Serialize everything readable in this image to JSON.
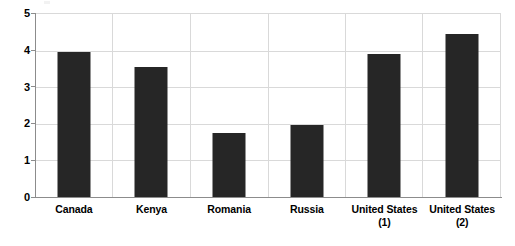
{
  "chart_data": {
    "type": "bar",
    "title": "",
    "subtitle": "",
    "xlabel": "",
    "ylabel": "",
    "categories": [
      "Canada",
      "Kenya",
      "Romania",
      "Russia",
      "United States (1)",
      "United States (2)"
    ],
    "category_lines": [
      [
        "Canada"
      ],
      [
        "Kenya"
      ],
      [
        "Romania"
      ],
      [
        "Russia"
      ],
      [
        "United States",
        "(1)"
      ],
      [
        "United States",
        "(2)"
      ]
    ],
    "values": [
      3.93,
      3.53,
      1.75,
      1.97,
      3.89,
      4.43
    ],
    "series": [
      {
        "name": "",
        "values": [
          3.93,
          3.53,
          1.75,
          1.97,
          3.89,
          4.43
        ]
      }
    ],
    "ylim": [
      0,
      5
    ],
    "ytick_labels": [
      "5",
      "4",
      "3",
      "2",
      "1",
      "0"
    ],
    "ytick_values": [
      5,
      4,
      3,
      2,
      1,
      0
    ],
    "grid": {
      "horizontal": true,
      "vertical": true
    },
    "legend": {
      "visible": false,
      "position": "none",
      "entries": []
    },
    "colors": {
      "bar": "#262626",
      "gridline": "#d9d9d9",
      "axis": "#8c8c8c",
      "background": "#ffffff",
      "text": "#000000"
    }
  }
}
